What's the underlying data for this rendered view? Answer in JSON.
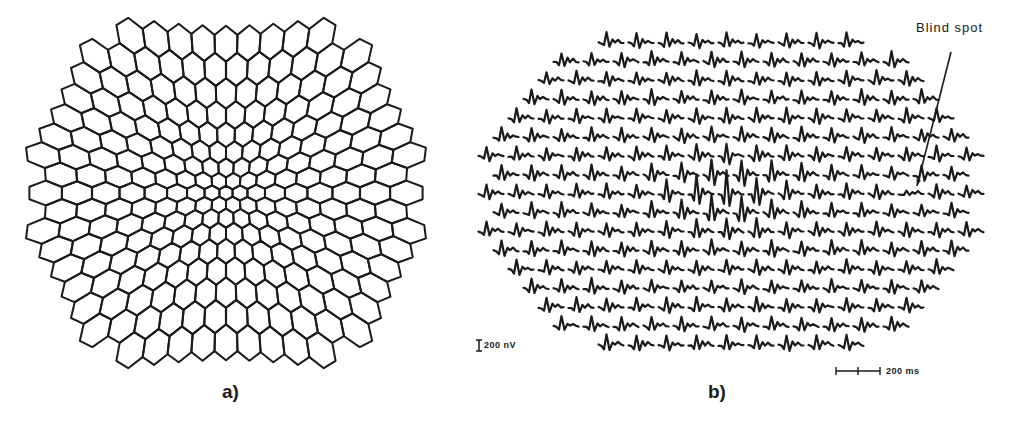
{
  "figure": {
    "panel_a": {
      "label": "a)",
      "description": "241-element scaled hexagonal stimulus array",
      "row_counts": [
        9,
        12,
        13,
        14,
        15,
        16,
        17,
        16,
        17,
        16,
        17,
        16,
        15,
        14,
        13,
        12,
        9
      ],
      "center": [
        226,
        193
      ],
      "extent_x": [
        38,
        415
      ],
      "extent_y": [
        32,
        356
      ],
      "stroke_color": "#1a1a1a"
    },
    "panel_b": {
      "label": "b)",
      "description": "Trace array of 241 local responses",
      "row_counts": [
        9,
        12,
        13,
        14,
        15,
        16,
        17,
        16,
        17,
        16,
        17,
        16,
        15,
        14,
        13,
        12,
        9
      ],
      "row_y_top": 42,
      "row_spacing": 18.9,
      "center_x": 731,
      "trace_pitch": 30,
      "trace_width": 25,
      "stroke_color": "#1a1a1a",
      "annotation": {
        "text": "Blind spot",
        "label_pos": [
          916,
          28
        ],
        "arrow_from": [
          951,
          52
        ],
        "arrow_to": [
          917,
          186
        ]
      },
      "amplitude_scale": {
        "label": "200 nV",
        "bar_x": 479,
        "bar_y": [
          340,
          351
        ]
      },
      "time_scale": {
        "label": "200 ms",
        "bar_x": [
          836,
          880
        ],
        "mid_tick_x": 858,
        "bar_y": 371
      }
    }
  }
}
